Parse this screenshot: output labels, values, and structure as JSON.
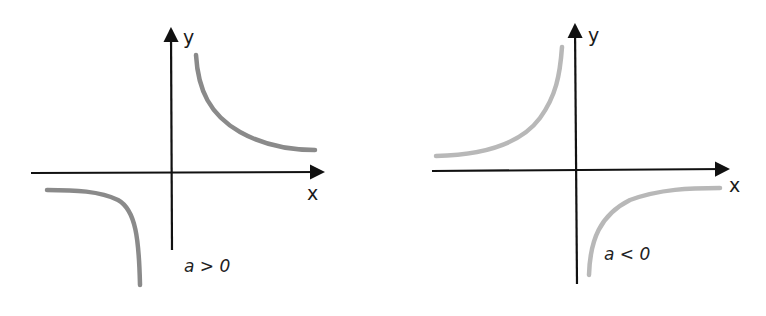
{
  "panels": [
    {
      "id": "positive",
      "condition": "a > 0",
      "x_label": "x",
      "y_label": "y",
      "curve_color": "#8a8a8a",
      "description": "Hyperbola branches in quadrants I and III"
    },
    {
      "id": "negative",
      "condition": "a < 0",
      "x_label": "x",
      "y_label": "y",
      "curve_color": "#b8b8b8",
      "description": "Hyperbola branches in quadrants II and IV"
    }
  ],
  "colors": {
    "axis": "#111111",
    "background": "#ffffff"
  }
}
